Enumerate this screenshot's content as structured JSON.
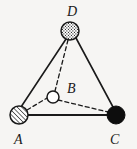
{
  "figure": {
    "type": "geometry-diagram",
    "name": "tetrahedron-abcd",
    "background_color": "#f6f5f3",
    "stroke_color": "#1a1a1a",
    "width": 137,
    "height": 149
  },
  "vertices": [
    {
      "id": "D",
      "label": "D",
      "cx": 70,
      "cy": 31,
      "r": 9,
      "fill_style": "stippled",
      "fill_color": "#ffffff",
      "stroke_color": "#1a1a1a",
      "label_x": 67,
      "label_y": 16
    },
    {
      "id": "B",
      "label": "B",
      "cx": 53,
      "cy": 97,
      "r": 6,
      "fill_style": "open",
      "fill_color": "#ffffff",
      "stroke_color": "#1a1a1a",
      "label_x": 67,
      "label_y": 93
    },
    {
      "id": "A",
      "label": "A",
      "cx": 19,
      "cy": 115,
      "r": 9,
      "fill_style": "hatched",
      "fill_color": "#ffffff",
      "stroke_color": "#1a1a1a",
      "label_x": 14,
      "label_y": 144
    },
    {
      "id": "C",
      "label": "C",
      "cx": 116,
      "cy": 115,
      "r": 9,
      "fill_style": "solid",
      "fill_color": "#0d0d0d",
      "stroke_color": "#0d0d0d",
      "label_x": 110,
      "label_y": 144
    }
  ],
  "edges": [
    {
      "id": "DA",
      "from": "D",
      "to": "A",
      "style": "solid",
      "x1": 66,
      "y1": 39,
      "x2": 21,
      "y2": 107,
      "width": 1.6
    },
    {
      "id": "DC",
      "from": "D",
      "to": "C",
      "style": "solid",
      "x1": 76,
      "y1": 38,
      "x2": 113,
      "y2": 107,
      "width": 1.6
    },
    {
      "id": "AC",
      "from": "A",
      "to": "C",
      "style": "solid",
      "x1": 28,
      "y1": 115,
      "x2": 107,
      "y2": 115,
      "width": 1.8
    },
    {
      "id": "DB",
      "from": "D",
      "to": "B",
      "style": "dashed",
      "x1": 68,
      "y1": 40,
      "x2": 55,
      "y2": 91,
      "width": 1.3,
      "dash": "4 3"
    },
    {
      "id": "AB",
      "from": "A",
      "to": "B",
      "style": "dashed",
      "x1": 27,
      "y1": 110,
      "x2": 47,
      "y2": 98,
      "width": 1.3,
      "dash": "4 3"
    },
    {
      "id": "BC",
      "from": "B",
      "to": "C",
      "style": "dashed",
      "x1": 58,
      "y1": 100,
      "x2": 108,
      "y2": 112,
      "width": 1.3,
      "dash": "4 3"
    }
  ]
}
